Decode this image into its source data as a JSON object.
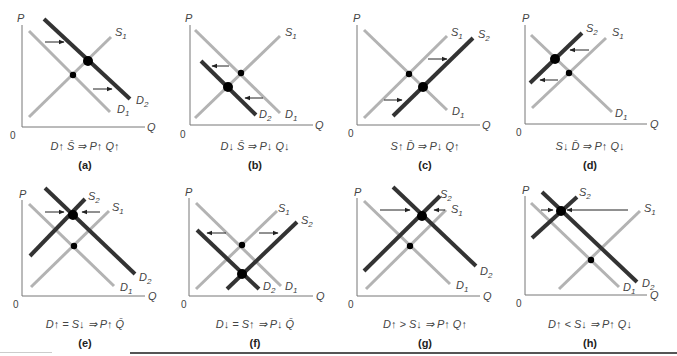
{
  "colors": {
    "old_curve": "#b3b3b3",
    "new_curve": "#444444",
    "axis": "#666666",
    "point": "#000000"
  },
  "axes": {
    "y_label": "P",
    "x_label": "Q",
    "origin_label": "0"
  },
  "panels": [
    {
      "id": "a",
      "letter": "(a)",
      "formula": "D↑ S̄ ⇒ P↑ Q↑",
      "curves": {
        "old": [
          "S1",
          "D1"
        ],
        "new": [
          "D2"
        ]
      },
      "labels": {
        "S1": "S",
        "D1": "D",
        "D2": "D"
      }
    },
    {
      "id": "b",
      "letter": "(b)",
      "formula": "D↓ S̄ ⇒ P↓ Q↓",
      "curves": {
        "old": [
          "S1",
          "D1"
        ],
        "new": [
          "D2"
        ]
      }
    },
    {
      "id": "c",
      "letter": "(c)",
      "formula": "S↑ D̄ ⇒ P↓ Q↑",
      "curves": {
        "old": [
          "S1",
          "D1"
        ],
        "new": [
          "S2"
        ]
      }
    },
    {
      "id": "d",
      "letter": "(d)",
      "formula": "S↓ D̄ ⇒ P↑ Q↓",
      "curves": {
        "old": [
          "S1",
          "D1"
        ],
        "new": [
          "S2"
        ]
      }
    },
    {
      "id": "e",
      "letter": "(e)",
      "formula": "D↑ = S↓ ⇒ P↑ Q̄",
      "curves": {
        "old": [
          "S1",
          "D1"
        ],
        "new": [
          "S2",
          "D2"
        ]
      }
    },
    {
      "id": "f",
      "letter": "(f)",
      "formula": "D↓ = S↑ ⇒ P↓ Q̄",
      "curves": {
        "old": [
          "S1",
          "D1"
        ],
        "new": [
          "S2",
          "D2"
        ]
      }
    },
    {
      "id": "g",
      "letter": "(g)",
      "formula": "D↑ > S↓ ⇒ P↑ Q↑",
      "curves": {
        "old": [
          "S1",
          "D1"
        ],
        "new": [
          "S2",
          "D2"
        ]
      }
    },
    {
      "id": "h",
      "letter": "(h)",
      "formula": "D↑ < S↓ ⇒ P↑ Q↓",
      "curves": {
        "old": [
          "S1",
          "D1"
        ],
        "new": [
          "S2",
          "D2"
        ]
      }
    }
  ],
  "curve_labels": {
    "S": "S",
    "D": "D",
    "sub1": "1",
    "sub2": "2"
  }
}
